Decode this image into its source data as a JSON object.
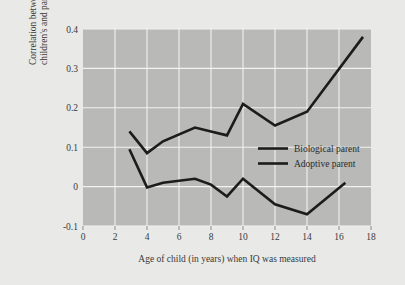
{
  "chart_data": {
    "type": "line",
    "title": "",
    "xlabel": "Age of child (in years) when IQ was measured",
    "ylabel": "Correlation between children's and parents' IQ scores",
    "xlim": [
      0,
      18
    ],
    "ylim": [
      -0.1,
      0.4
    ],
    "xticks": [
      "0",
      "2",
      "4",
      "6",
      "8",
      "10",
      "12",
      "14",
      "16",
      "18"
    ],
    "xtick_values": [
      0,
      2,
      4,
      6,
      8,
      10,
      12,
      14,
      16,
      18
    ],
    "yticks": [
      "0.4",
      "0.3",
      "0.2",
      "0.1",
      "0",
      "-0.1"
    ],
    "ytick_values": [
      0.4,
      0.3,
      0.2,
      0.1,
      0,
      -0.1
    ],
    "grid": true,
    "grid_color": "#f2f2f0",
    "plot_background": "#b9b9b7",
    "figure_background": "#e9e9e7",
    "line_color": "#1c1c1c",
    "legend_position": "center-right",
    "series": [
      {
        "name": "Biological parent",
        "x": [
          2.9,
          4,
          5,
          7,
          8,
          9,
          10,
          12,
          14,
          17.5
        ],
        "values": [
          0.14,
          0.085,
          0.115,
          0.15,
          0.14,
          0.13,
          0.21,
          0.155,
          0.19,
          0.38
        ]
      },
      {
        "name": "Adoptive parent",
        "x": [
          2.9,
          4,
          5,
          7,
          8,
          9,
          10,
          12,
          14,
          16.4
        ],
        "values": [
          0.095,
          -0.002,
          0.01,
          0.02,
          0.005,
          -0.025,
          0.02,
          -0.045,
          -0.07,
          0.01
        ]
      }
    ],
    "legend": [
      "Biological parent",
      "Adoptive parent"
    ]
  }
}
